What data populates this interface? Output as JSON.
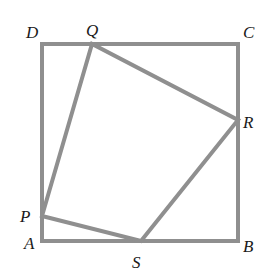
{
  "diagram": {
    "colors": {
      "stroke": "#8f8f8f",
      "label": "#1a1a1a",
      "background": "#ffffff"
    },
    "square": {
      "vertices": [
        {
          "name": "A",
          "label": "A",
          "x": 42,
          "y": 241,
          "label_x": 24,
          "label_y": 249
        },
        {
          "name": "B",
          "label": "B",
          "x": 238,
          "y": 241,
          "label_x": 243,
          "label_y": 252
        },
        {
          "name": "C",
          "label": "C",
          "x": 238,
          "y": 44,
          "label_x": 243,
          "label_y": 38
        },
        {
          "name": "D",
          "label": "D",
          "x": 42,
          "y": 44,
          "label_x": 26,
          "label_y": 38
        }
      ]
    },
    "inner_quadrilateral": {
      "vertices": [
        {
          "name": "P",
          "label": "P",
          "x": 42,
          "y": 216,
          "label_x": 20,
          "label_y": 222,
          "on_side": "AD"
        },
        {
          "name": "Q",
          "label": "Q",
          "x": 92,
          "y": 44,
          "label_x": 86,
          "label_y": 36,
          "on_side": "DC"
        },
        {
          "name": "R",
          "label": "R",
          "x": 238,
          "y": 120,
          "label_x": 243,
          "label_y": 128,
          "on_side": "CB"
        },
        {
          "name": "S",
          "label": "S",
          "x": 141,
          "y": 241,
          "label_x": 132,
          "label_y": 268,
          "on_side": "AB"
        }
      ]
    }
  }
}
